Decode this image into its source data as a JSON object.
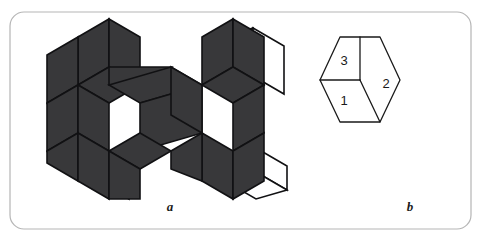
{
  "figure": {
    "background_color": "#ffffff",
    "frame": {
      "name": "rounded-frame",
      "x": 10,
      "y": 12,
      "width": 461,
      "height": 217,
      "radius": 14,
      "stroke_color": "#b5b5b5",
      "stroke_width": 1.2,
      "fill": "#ffffff"
    },
    "panels": [
      {
        "id": "a",
        "caption": "a",
        "caption_x": 170,
        "caption_y": 207
      },
      {
        "id": "b",
        "caption": "b",
        "caption_x": 410,
        "caption_y": 207
      }
    ],
    "colors": {
      "dark_face": "#38383a",
      "flap_fill": "#ffffff",
      "outline": "#111113",
      "frame": "#b5b5b5",
      "label_text": "#1a1a1a"
    }
  },
  "panel_a": {
    "name": "rhombic-net",
    "description": "Unfolded net of rhombic faces, dark filled, with white fold flaps",
    "outline_width": 1.6,
    "flaps": [
      {
        "name": "flap-top-right-upper",
        "points": "222,39 253,28 253,76 222,87"
      },
      {
        "name": "flap-right-upper",
        "points": "253,28 284,46 284,94 253,76"
      },
      {
        "name": "flap-right-lower",
        "points": "256,148 287,166 287,190 256,172"
      },
      {
        "name": "flap-bottom-right",
        "points": "256,172 287,190 256,199 225,181"
      },
      {
        "name": "flap-bottom-left",
        "points": "98,156 129,174 129,199 98,181"
      }
    ],
    "faces": [
      {
        "name": "face-top-left",
        "points": "78,37 109,19 109,67 78,85"
      },
      {
        "name": "face-top-center",
        "points": "109,19 140,37 140,85 109,67"
      },
      {
        "name": "face-upper-left",
        "points": "47,55 78,37 78,85 47,103"
      },
      {
        "name": "face-upper-midleft",
        "points": "78,85 109,67 140,85 109,103"
      },
      {
        "name": "face-mid-band-1",
        "points": "109,67 171,67 140,85 109,85"
      },
      {
        "name": "face-mid-left",
        "points": "47,103 78,85 78,133 47,151"
      },
      {
        "name": "face-mid-center-a",
        "points": "109,85 171,67 202,85 140,103"
      },
      {
        "name": "face-mid-center-b",
        "points": "140,103 202,85 202,133 140,151"
      },
      {
        "name": "face-mid-left-low",
        "points": "78,85 109,103 109,151 78,133"
      },
      {
        "name": "face-low-left",
        "points": "47,151 78,133 78,181 47,163"
      },
      {
        "name": "face-low-midleft",
        "points": "78,133 109,151 109,199 78,181"
      },
      {
        "name": "face-low-center",
        "points": "109,151 140,133 171,151 140,169"
      },
      {
        "name": "face-low-center-b",
        "points": "109,151 140,169 140,199 109,199"
      },
      {
        "name": "face-right-top",
        "points": "202,37 233,19 233,67 202,85"
      },
      {
        "name": "face-right-top-2",
        "points": "233,19 264,37 264,85 233,67"
      },
      {
        "name": "face-right-mid",
        "points": "171,67 202,85 202,133 171,115"
      },
      {
        "name": "face-right-mid-2",
        "points": "202,85 233,67 264,85 233,103"
      },
      {
        "name": "face-right-mid-3",
        "points": "233,103 264,85 264,133 233,151"
      },
      {
        "name": "face-right-low",
        "points": "202,133 233,151 233,199 202,181"
      },
      {
        "name": "face-right-low-2",
        "points": "233,151 264,133 264,181 233,199"
      },
      {
        "name": "face-right-low-3",
        "points": "171,151 202,133 202,181 171,169"
      }
    ]
  },
  "panel_b": {
    "name": "cube-projection",
    "description": "Hexagonal outline of a cube seen along a body diagonal, three visible rhombic faces numbered",
    "outline_width": 1.3,
    "outline_color": "#1a1a1a",
    "fill": "#ffffff",
    "hexagon_points": "320,80 340,37 380,37 400,80 380,122 340,122",
    "center_vertex": {
      "x": 360,
      "y": 80
    },
    "edges": [
      {
        "name": "edge-center-to-top",
        "from": [
          360,
          80
        ],
        "to": [
          360,
          37
        ]
      },
      {
        "name": "edge-center-to-left",
        "from": [
          360,
          80
        ],
        "to": [
          320,
          80
        ]
      },
      {
        "name": "edge-center-to-bottom",
        "from": [
          360,
          80
        ],
        "to": [
          380,
          122
        ]
      }
    ],
    "faces": [
      {
        "id": "3",
        "name": "cube-face-3",
        "label": "3",
        "label_x": 344,
        "label_y": 62
      },
      {
        "id": "2",
        "name": "cube-face-2",
        "label": "2",
        "label_x": 386,
        "label_y": 85
      },
      {
        "id": "1",
        "name": "cube-face-1",
        "label": "1",
        "label_x": 344,
        "label_y": 102
      }
    ],
    "label_font_size": 13,
    "label_color": "#1a1a1a"
  }
}
